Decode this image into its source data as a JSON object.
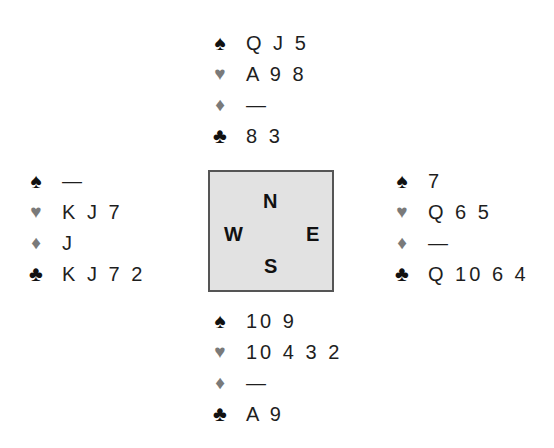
{
  "suit_symbols": {
    "spades": "♠",
    "hearts": "♥",
    "diamonds": "♦",
    "clubs": "♣"
  },
  "colors": {
    "black_suit": "#111111",
    "red_suit_gray": "#7a7a7a",
    "compass_fill": "#e2e2e2",
    "compass_border": "#555555"
  },
  "compass": {
    "north": "N",
    "west": "W",
    "east": "E",
    "south": "S"
  },
  "hands": {
    "north": {
      "spades": "Q J 5",
      "hearts": "A 9 8",
      "diamonds": "—",
      "clubs": "8 3"
    },
    "west": {
      "spades": "—",
      "hearts": "K J 7",
      "diamonds": "J",
      "clubs": "K J 7 2"
    },
    "east": {
      "spades": "7",
      "hearts": "Q 6 5",
      "diamonds": "—",
      "clubs": "Q 10 6 4"
    },
    "south": {
      "spades": "10 9",
      "hearts": "10 4 3 2",
      "diamonds": "—",
      "clubs": "A 9"
    }
  }
}
